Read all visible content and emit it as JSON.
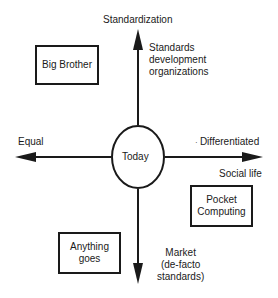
{
  "axes": {
    "top": "Standardization",
    "bottom": "Market\n(de-facto\nstandards)",
    "bottom_lines": [
      "Market",
      "(de-facto",
      "standards)"
    ],
    "left": "Equal",
    "right": "Differentiated",
    "right_sub": "Social life",
    "top_sub_lines": [
      "Standards",
      "development",
      "organizations"
    ]
  },
  "center": {
    "label": "Today"
  },
  "quadrant_boxes": [
    {
      "lines": [
        "Big Brother"
      ]
    },
    {
      "lines": [
        "Pocket",
        "Computing"
      ]
    },
    {
      "lines": [
        "Anything",
        "goes"
      ]
    }
  ],
  "colors": {
    "stroke": "#1a1a1a",
    "background": "#ffffff"
  }
}
